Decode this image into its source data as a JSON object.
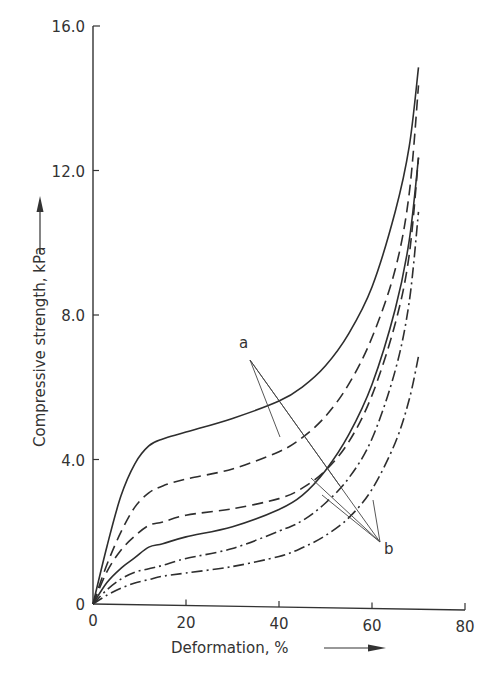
{
  "chart_data": {
    "type": "line",
    "title": "",
    "xlabel": "Deformation, %",
    "ylabel": "Compressive strength, kPa",
    "xlim": [
      0,
      80
    ],
    "ylim": [
      0,
      16
    ],
    "x_ticks": [
      "0",
      "20",
      "40",
      "60",
      "80"
    ],
    "y_ticks": [
      "0",
      "4.0",
      "8.0",
      "12.0",
      "16.0"
    ],
    "grid": false,
    "legend": null,
    "annotations": [
      {
        "label": "a",
        "points_to": [
          "solid-upper",
          "dashed-upper"
        ]
      },
      {
        "label": "b",
        "points_to": [
          "dashed-lower",
          "solid-lower",
          "dashdot-upper",
          "dashdot-lower"
        ]
      }
    ],
    "series": [
      {
        "name": "solid-upper",
        "style": "solid",
        "group": "a",
        "x": [
          0,
          3,
          6,
          9,
          12,
          15,
          20,
          30,
          40,
          45,
          50,
          55,
          60,
          65,
          68,
          70
        ],
        "y": [
          0,
          1.6,
          3.0,
          3.9,
          4.4,
          4.6,
          4.8,
          5.2,
          5.7,
          6.1,
          6.7,
          7.6,
          8.9,
          11.0,
          12.8,
          15.0
        ]
      },
      {
        "name": "dashed-upper",
        "style": "dashed",
        "group": "a",
        "x": [
          0,
          3,
          6,
          9,
          12,
          15,
          20,
          30,
          40,
          45,
          50,
          55,
          60,
          65,
          68,
          70
        ],
        "y": [
          0,
          1.1,
          2.0,
          2.7,
          3.1,
          3.3,
          3.5,
          3.8,
          4.3,
          4.7,
          5.3,
          6.2,
          7.5,
          9.4,
          11.5,
          14.5
        ]
      },
      {
        "name": "dashed-lower",
        "style": "dashed",
        "group": "b",
        "x": [
          0,
          3,
          6,
          9,
          12,
          15,
          20,
          30,
          40,
          45,
          50,
          55,
          60,
          65,
          68,
          70
        ],
        "y": [
          0,
          0.9,
          1.5,
          1.9,
          2.2,
          2.3,
          2.5,
          2.7,
          3.0,
          3.3,
          3.8,
          4.6,
          5.9,
          7.9,
          9.8,
          12.5
        ]
      },
      {
        "name": "solid-lower",
        "style": "solid",
        "group": "b",
        "x": [
          0,
          3,
          6,
          9,
          12,
          15,
          20,
          30,
          40,
          45,
          50,
          55,
          60,
          65,
          68,
          70
        ],
        "y": [
          0,
          0.6,
          1.0,
          1.3,
          1.6,
          1.7,
          1.9,
          2.2,
          2.7,
          3.1,
          3.8,
          4.8,
          6.2,
          8.3,
          10.2,
          12.5
        ]
      },
      {
        "name": "dashdot-upper",
        "style": "dash-dot",
        "group": "b",
        "x": [
          0,
          3,
          6,
          9,
          12,
          15,
          20,
          30,
          40,
          45,
          50,
          55,
          60,
          65,
          68,
          70
        ],
        "y": [
          0,
          0.4,
          0.7,
          0.9,
          1.0,
          1.1,
          1.3,
          1.6,
          2.1,
          2.4,
          2.9,
          3.6,
          4.7,
          6.6,
          8.5,
          11.0
        ]
      },
      {
        "name": "dashdot-lower",
        "style": "dash-dot",
        "group": "b",
        "x": [
          0,
          3,
          6,
          9,
          12,
          15,
          20,
          30,
          40,
          45,
          50,
          55,
          60,
          65,
          68,
          70
        ],
        "y": [
          0,
          0.25,
          0.45,
          0.6,
          0.7,
          0.8,
          0.9,
          1.1,
          1.4,
          1.65,
          2.0,
          2.5,
          3.3,
          4.6,
          5.8,
          7.0
        ]
      }
    ]
  }
}
